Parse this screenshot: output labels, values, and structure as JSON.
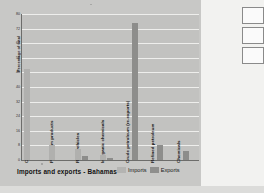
{
  "chart_data": {
    "type": "bar",
    "title": "Imports and exports - Bahamas",
    "xlabel": "",
    "ylabel": "Percentage of total",
    "ylim": [
      0,
      80
    ],
    "yticks": [
      0,
      8,
      16,
      24,
      32,
      40,
      48,
      56,
      64,
      72,
      80
    ],
    "grid": true,
    "legend_position": "bottom-right",
    "categories": [
      "Crude petroleum",
      "Petroleum products",
      "Road vehicles",
      "Inorganic chemicals",
      "Crude petroleum (re-exports)",
      "Refined petroleum",
      "Chemicals"
    ],
    "series": [
      {
        "name": "Imports",
        "values": [
          50,
          8,
          6,
          3,
          0,
          0,
          0
        ]
      },
      {
        "name": "Exports",
        "values": [
          0,
          0,
          2,
          1,
          75,
          8,
          5
        ]
      }
    ]
  },
  "chart": {
    "title": "Imports and exports - Bahamas",
    "y_axis_title": "Percentage of total"
  },
  "legend": {
    "imports_label": "Imports",
    "exports_label": "Exports"
  }
}
